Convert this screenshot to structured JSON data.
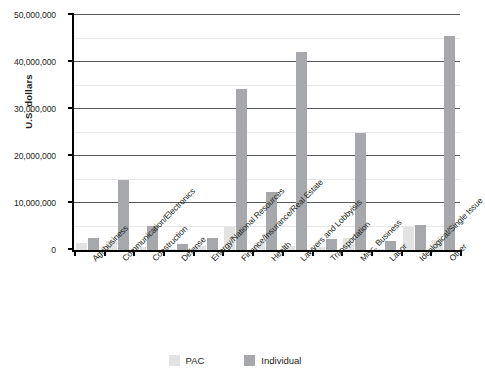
{
  "chart_data": {
    "type": "bar",
    "title": "",
    "xlabel": "",
    "ylabel": "U.S. dollars",
    "ylim": [
      0,
      50000000
    ],
    "yticks": [
      0,
      10000000,
      20000000,
      30000000,
      40000000,
      50000000
    ],
    "ytick_labels": [
      "0",
      "10,000,000",
      "20,000,000",
      "30,000,000",
      "40,000,000",
      "50,000,000"
    ],
    "grid": true,
    "legend_position": "bottom",
    "categories": [
      "Agribusiness",
      "Communication/Electronics",
      "Construction",
      "Defense",
      "Energy/National Resources",
      "Finance/Insurance/Real Estate",
      "Health",
      "Lawyers and Lobbyists",
      "Transportation",
      "Misc. Business",
      "Labor",
      "Ideological/Single Issue",
      "Other"
    ],
    "series": [
      {
        "name": "PAC",
        "color": "#e3e3e3",
        "values": [
          1500000,
          2000000,
          700000,
          300000,
          900000,
          5000000,
          1500000,
          800000,
          700000,
          2600000,
          300000,
          4800000,
          2200000
        ]
      },
      {
        "name": "Individual",
        "color": "#a6a8ab",
        "values": [
          2600000,
          15000000,
          5100000,
          1200000,
          2500000,
          34300000,
          12300000,
          42200000,
          2300000,
          25000000,
          2000000,
          5300000,
          45500000
        ]
      }
    ]
  },
  "legend": {
    "items": [
      {
        "label": "PAC"
      },
      {
        "label": "Individual"
      }
    ]
  },
  "axis": {
    "y_title": "U.S. dollars"
  }
}
